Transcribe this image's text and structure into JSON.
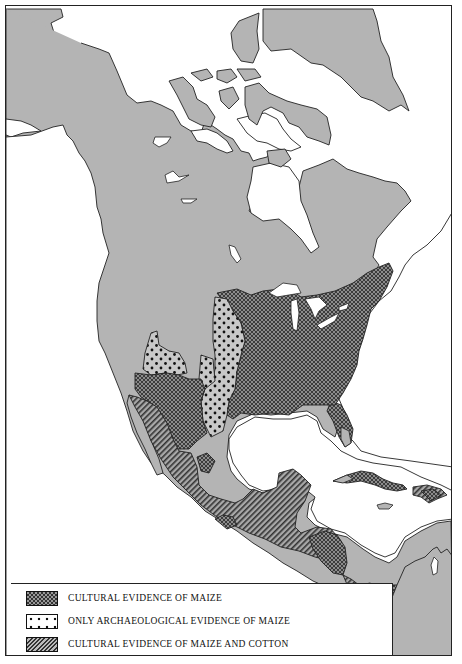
{
  "map": {
    "subject": "North America",
    "colors": {
      "land": "#b4b4b4",
      "water": "#ffffff",
      "coastline": "#222222",
      "crosshatch_fill": "#5a5a5a",
      "dot_fill": "#c4c4c4",
      "stripe_fill": "#8a8a8a"
    },
    "regions": [
      {
        "name": "Eastern Woodlands / Mississippi",
        "pattern": "crosshatch"
      },
      {
        "name": "Plains / Southwest margin",
        "pattern": "dots"
      },
      {
        "name": "Northwest Mexico interior",
        "pattern": "crosshatch"
      },
      {
        "name": "West Mexico / Mesoamerica",
        "pattern": "stripes"
      },
      {
        "name": "Greater Antilles",
        "pattern": "crosshatch"
      },
      {
        "name": "Central America isthmus",
        "pattern": "crosshatch"
      }
    ]
  },
  "legend": {
    "items": [
      {
        "pattern": "crosshatch",
        "label": "CULTURAL EVIDENCE OF MAIZE"
      },
      {
        "pattern": "dots",
        "label": "ONLY ARCHAEOLOGICAL EVIDENCE OF MAIZE"
      },
      {
        "pattern": "stripes",
        "label": "CULTURAL EVIDENCE OF MAIZE AND COTTON"
      }
    ]
  }
}
